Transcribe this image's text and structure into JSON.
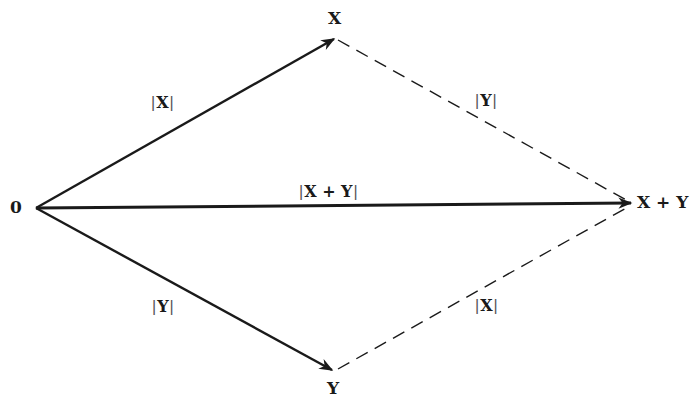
{
  "diagram": {
    "points": {
      "origin": "0",
      "x": "X",
      "y": "Y",
      "sum": "X + Y"
    },
    "edge_labels": {
      "origin_to_x": {
        "open": "|",
        "body": "X",
        "close": "|"
      },
      "x_to_sum": {
        "open": "|",
        "body": "Y",
        "close": "|"
      },
      "origin_to_sum": {
        "open": "|",
        "body": "X + Y",
        "close": "|"
      },
      "origin_to_y": {
        "open": "|",
        "body": "Y",
        "close": "|"
      },
      "y_to_sum": {
        "open": "|",
        "body": "X",
        "close": "|"
      }
    },
    "colors": {
      "ink": "#1a1a1a",
      "background": "#ffffff"
    }
  }
}
